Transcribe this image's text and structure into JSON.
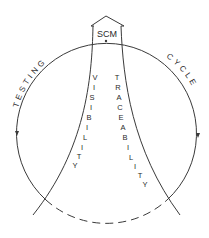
{
  "diagram": {
    "top_label": "SCM",
    "left_arc_label": "TESTING",
    "right_arc_label": "CYCLE",
    "left_band_label": "VISIBILITY",
    "right_band_label": "TRACEABILITY",
    "left_band_letters": [
      "V",
      "I",
      "S",
      "I",
      "B",
      "I",
      "L",
      "I",
      "T",
      "Y"
    ],
    "right_band_letters": [
      "T",
      "R",
      "A",
      "C",
      "E",
      "A",
      "B",
      "I",
      "L",
      "I",
      "T",
      "Y"
    ],
    "stroke_color": "#3a3a3a",
    "background_color": "#ffffff"
  }
}
